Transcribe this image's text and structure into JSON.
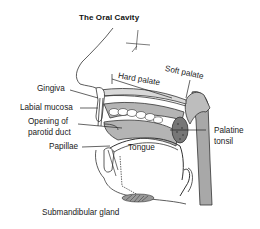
{
  "title": "The Oral Cavity",
  "labels": {
    "gingiva": "Gingiva",
    "labial_mucosa": "Labial mucosa",
    "opening_parotid_1": "Opening of",
    "opening_parotid_2": "parotid duct",
    "papillae": "Papillae",
    "tongue": "Tongue",
    "hard_palate": "Hard palate",
    "soft_palate": "Soft palate",
    "palatine_1": "Palatine",
    "palatine_2": "tonsil",
    "submandibular": "Submandibular gland"
  },
  "colors": {
    "tissue_gray": "#b4b4b4",
    "pharynx_gray": "#a8a8a8",
    "line": "#222222"
  }
}
